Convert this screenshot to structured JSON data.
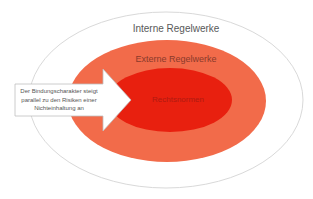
{
  "diagram": {
    "type": "nested-ellipses",
    "layers": [
      {
        "label": "Interne Regelwerke",
        "fill": "#ffffff",
        "stroke": "#d9d9d9"
      },
      {
        "label": "Externe Regelwerke",
        "fill": "#f26b4a"
      },
      {
        "label": "Rechtsnormen",
        "fill": "#e8200f"
      }
    ],
    "arrow": {
      "text_lines": [
        "Der Bindungscharakter steigt",
        "parallel zu den Risiken einer",
        "Nichteinhaltung an"
      ],
      "fill": "#ffffff",
      "stroke": "#bfbfbf"
    }
  }
}
